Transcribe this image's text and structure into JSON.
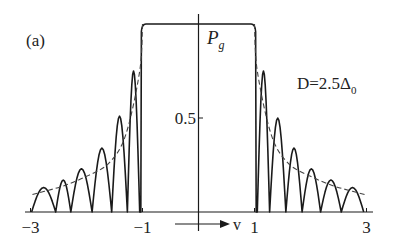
{
  "chart_data": {
    "type": "line",
    "panel_label": "(a)",
    "ylabel": "P",
    "ylabel_subscript": "g",
    "xlabel": "v",
    "annotation": {
      "text": "D=2.5Δ",
      "subscript": "0"
    },
    "xlim": [
      -3,
      3
    ],
    "ylim": [
      0,
      1
    ],
    "x_ticks": [
      {
        "value": -3,
        "label": "−3"
      },
      {
        "value": -1,
        "label": "−1"
      },
      {
        "value": 1,
        "label": "1"
      },
      {
        "value": 3,
        "label": "3"
      }
    ],
    "y_ticks": [
      {
        "value": 0.5,
        "label": "0.5"
      }
    ],
    "grid": false,
    "legend": null,
    "series": [
      {
        "name": "exact (oscillating)",
        "style": "solid",
        "plateau": {
          "from": -1,
          "to": 1,
          "value": 1.0
        },
        "peaks_right": [
          {
            "v": 1.15,
            "p": 0.75
          },
          {
            "v": 1.4,
            "p": 0.5
          },
          {
            "v": 1.71,
            "p": 0.34
          },
          {
            "v": 2.01,
            "p": 0.23
          },
          {
            "v": 2.35,
            "p": 0.17
          },
          {
            "v": 2.76,
            "p": 0.13
          }
        ],
        "zeros_right": [
          1.05,
          1.27,
          1.56,
          1.85,
          2.18,
          2.55,
          2.95
        ],
        "peaks_left": [
          {
            "v": -1.15,
            "p": 0.75
          },
          {
            "v": -1.4,
            "p": 0.51
          },
          {
            "v": -1.7,
            "p": 0.34
          },
          {
            "v": -2.12,
            "p": 0.23
          },
          {
            "v": -2.4,
            "p": 0.17
          },
          {
            "v": -2.78,
            "p": 0.13
          }
        ],
        "zeros_left": [
          -1.05,
          -1.27,
          -1.55,
          -1.9,
          -2.28,
          -2.55,
          -2.98
        ]
      },
      {
        "name": "averaged",
        "style": "dashed",
        "points_right": [
          {
            "v": 1.0,
            "p": 1.0
          },
          {
            "v": 1.05,
            "p": 0.75
          },
          {
            "v": 1.3,
            "p": 0.41
          },
          {
            "v": 1.6,
            "p": 0.26
          },
          {
            "v": 2.0,
            "p": 0.19
          },
          {
            "v": 2.4,
            "p": 0.14
          },
          {
            "v": 2.75,
            "p": 0.11
          },
          {
            "v": 3.0,
            "p": 0.09
          }
        ],
        "points_left": [
          {
            "v": -1.0,
            "p": 1.0
          },
          {
            "v": -1.05,
            "p": 0.75
          },
          {
            "v": -1.3,
            "p": 0.41
          },
          {
            "v": -1.6,
            "p": 0.26
          },
          {
            "v": -2.0,
            "p": 0.19
          },
          {
            "v": -2.4,
            "p": 0.14
          },
          {
            "v": -2.75,
            "p": 0.11
          },
          {
            "v": -3.0,
            "p": 0.09
          }
        ]
      }
    ]
  }
}
